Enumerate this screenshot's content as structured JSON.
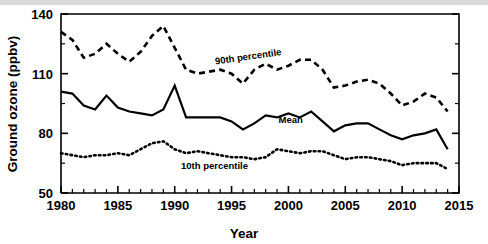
{
  "figure": {
    "background_color": "#ffffff",
    "ink_color": "#000000",
    "top_band_color": "#d9d9d9"
  },
  "chart_data": {
    "type": "line",
    "title": "",
    "xlabel": "Year",
    "ylabel": "Ground ozone (ppbv)",
    "xlim": [
      1980,
      2015
    ],
    "ylim": [
      50,
      140
    ],
    "grid": false,
    "legend_position": "inline-annotations",
    "x_major_ticks": [
      1980,
      1985,
      1990,
      1995,
      2000,
      2005,
      2010,
      2015
    ],
    "x_tick_labels": [
      "1980",
      "1985",
      "1990",
      "1995",
      "2000",
      "2005",
      "2010",
      "2015"
    ],
    "x_minor_tick_step": 1,
    "y_major_ticks": [
      50,
      80,
      110,
      140
    ],
    "y_tick_labels": [
      "50",
      "80",
      "110",
      "140"
    ],
    "y_minor_ticks": [
      65,
      95,
      125
    ],
    "x": [
      1980,
      1981,
      1982,
      1983,
      1984,
      1985,
      1986,
      1987,
      1988,
      1989,
      1990,
      1991,
      1992,
      1993,
      1994,
      1995,
      1996,
      1997,
      1998,
      1999,
      2000,
      2001,
      2002,
      2003,
      2004,
      2005,
      2006,
      2007,
      2008,
      2009,
      2010,
      2011,
      2012,
      2013,
      2014
    ],
    "series": [
      {
        "name": "90th percentile",
        "label": "90th percentile",
        "style": "dashed",
        "label_x": 1996.5,
        "label_y": 117,
        "label_rotation": -8,
        "values": [
          131,
          127,
          118,
          120,
          125,
          120,
          116,
          121,
          129,
          134,
          123,
          112,
          110,
          111,
          112,
          110,
          105,
          112,
          115,
          112,
          114,
          117,
          117,
          112,
          103,
          104,
          106,
          107,
          105,
          100,
          94,
          96,
          100,
          98,
          91
        ]
      },
      {
        "name": "Mean",
        "label": "Mean",
        "style": "solid",
        "label_x": 2000.2,
        "label_y": 85,
        "label_rotation": 0,
        "values": [
          101,
          100,
          94,
          92,
          99,
          93,
          91,
          90,
          89,
          92,
          104,
          88,
          88,
          88,
          88,
          86,
          82,
          85,
          89,
          88,
          90,
          88,
          91,
          86,
          81,
          84,
          85,
          85,
          82,
          79,
          77,
          79,
          80,
          82,
          72
        ]
      },
      {
        "name": "10th percentile",
        "label": "10th percentile",
        "style": "dotted",
        "label_x": 1993.5,
        "label_y": 62,
        "label_rotation": 0,
        "values": [
          70,
          69,
          68,
          69,
          69,
          70,
          69,
          72,
          75,
          76,
          72,
          70,
          71,
          70,
          69,
          68,
          68,
          67,
          68,
          72,
          71,
          70,
          71,
          71,
          69,
          67,
          68,
          68,
          67,
          66,
          64,
          65,
          65,
          65,
          62
        ]
      }
    ]
  }
}
